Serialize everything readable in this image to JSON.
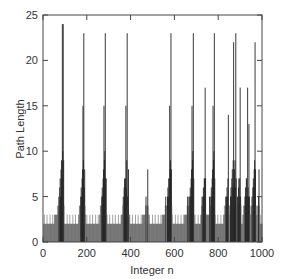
{
  "chart_data": {
    "type": "bar",
    "title": "",
    "xlabel": "Integer n",
    "ylabel": "Path Length",
    "xlim": [
      0,
      1000
    ],
    "ylim": [
      0,
      25
    ],
    "xticks": [
      0,
      200,
      400,
      600,
      800,
      1000
    ],
    "yticks": [
      0,
      5,
      10,
      15,
      20,
      25
    ],
    "grid": false,
    "legend": null,
    "bar_color": "#222222",
    "baseline_pattern": {
      "description": "dense vertical bars for every integer n; most values 1-2, occasional 3",
      "typical_values": [
        1,
        2
      ]
    },
    "peaks": [
      {
        "n": 88,
        "value": 24
      },
      {
        "n": 92,
        "value": 24
      },
      {
        "n": 75,
        "value": 6
      },
      {
        "n": 65,
        "value": 4
      },
      {
        "n": 186,
        "value": 23
      },
      {
        "n": 182,
        "value": 15
      },
      {
        "n": 190,
        "value": 8
      },
      {
        "n": 283,
        "value": 23
      },
      {
        "n": 278,
        "value": 15
      },
      {
        "n": 288,
        "value": 7
      },
      {
        "n": 383,
        "value": 23
      },
      {
        "n": 378,
        "value": 15
      },
      {
        "n": 390,
        "value": 8
      },
      {
        "n": 470,
        "value": 5
      },
      {
        "n": 478,
        "value": 8
      },
      {
        "n": 584,
        "value": 23
      },
      {
        "n": 578,
        "value": 15
      },
      {
        "n": 560,
        "value": 5
      },
      {
        "n": 685,
        "value": 23
      },
      {
        "n": 679,
        "value": 15
      },
      {
        "n": 660,
        "value": 5
      },
      {
        "n": 740,
        "value": 17
      },
      {
        "n": 781,
        "value": 23
      },
      {
        "n": 776,
        "value": 15
      },
      {
        "n": 760,
        "value": 5
      },
      {
        "n": 845,
        "value": 14
      },
      {
        "n": 870,
        "value": 22
      },
      {
        "n": 880,
        "value": 23
      },
      {
        "n": 900,
        "value": 17
      },
      {
        "n": 933,
        "value": 17
      },
      {
        "n": 940,
        "value": 13
      },
      {
        "n": 968,
        "value": 22
      },
      {
        "n": 985,
        "value": 8
      }
    ]
  }
}
